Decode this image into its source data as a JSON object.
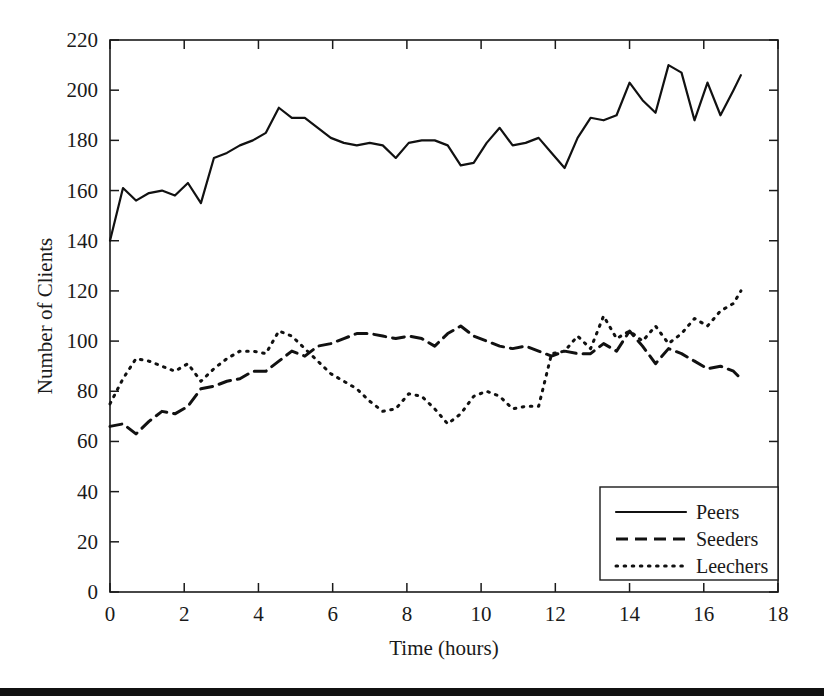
{
  "figure": {
    "background_color": "#ffffff",
    "ink_color": "#111111",
    "bottom_bar_color": "#111111"
  },
  "chart_data": {
    "type": "line",
    "title": "",
    "subtitle": "",
    "xlabel": "Time (hours)",
    "ylabel": "Number of Clients",
    "xlim": [
      0,
      18
    ],
    "ylim": [
      0,
      220
    ],
    "xticks": [
      0,
      2,
      4,
      6,
      8,
      10,
      12,
      14,
      16,
      18
    ],
    "yticks": [
      0,
      20,
      40,
      60,
      80,
      100,
      120,
      140,
      160,
      180,
      200,
      220
    ],
    "xtick_labels": [
      "0",
      "2",
      "4",
      "6",
      "8",
      "10",
      "12",
      "14",
      "16",
      "18"
    ],
    "ytick_labels": [
      "0",
      "20",
      "40",
      "60",
      "80",
      "100",
      "120",
      "140",
      "160",
      "180",
      "200",
      "220"
    ],
    "grid": false,
    "legend_position": "lower right",
    "legend_entries": [
      "Peers",
      "Seeders",
      "Leechers"
    ],
    "x": [
      0.0,
      0.35,
      0.7,
      1.05,
      1.4,
      1.75,
      2.1,
      2.45,
      2.8,
      3.15,
      3.5,
      3.85,
      4.2,
      4.55,
      4.9,
      5.25,
      5.6,
      5.95,
      6.3,
      6.65,
      7.0,
      7.35,
      7.7,
      8.05,
      8.4,
      8.75,
      9.1,
      9.45,
      9.8,
      10.15,
      10.5,
      10.85,
      11.2,
      11.55,
      11.9,
      12.25,
      12.6,
      12.95,
      13.3,
      13.65,
      14.0,
      14.35,
      14.7,
      15.05,
      15.4,
      15.75,
      16.1,
      16.45,
      16.8,
      17.0
    ],
    "series": [
      {
        "name": "Peers",
        "style": "solid",
        "color": "#111111",
        "values": [
          140,
          161,
          156,
          159,
          160,
          158,
          163,
          155,
          173,
          175,
          178,
          180,
          183,
          193,
          189,
          189,
          185,
          181,
          179,
          178,
          179,
          178,
          173,
          179,
          180,
          180,
          178,
          170,
          171,
          179,
          185,
          178,
          179,
          181,
          175,
          169,
          181,
          189,
          188,
          190,
          203,
          196,
          191,
          210,
          207,
          188,
          203,
          190,
          200,
          206
        ]
      },
      {
        "name": "Seeders",
        "style": "dashed",
        "color": "#111111",
        "values": [
          66,
          67,
          63,
          68,
          72,
          71,
          74,
          81,
          82,
          84,
          85,
          88,
          88,
          92,
          96,
          94,
          98,
          99,
          101,
          103,
          103,
          102,
          101,
          102,
          101,
          98,
          103,
          106,
          102,
          100,
          98,
          97,
          98,
          96,
          94,
          96,
          95,
          95,
          99,
          96,
          104,
          98,
          91,
          97,
          95,
          92,
          89,
          90,
          88,
          85
        ]
      },
      {
        "name": "Leechers",
        "style": "dotted",
        "color": "#111111",
        "values": [
          75,
          85,
          93,
          92,
          90,
          88,
          91,
          84,
          89,
          93,
          96,
          96,
          95,
          104,
          102,
          97,
          92,
          87,
          84,
          81,
          76,
          72,
          73,
          79,
          78,
          73,
          67,
          71,
          78,
          80,
          78,
          73,
          74,
          74,
          95,
          96,
          102,
          97,
          110,
          101,
          104,
          100,
          106,
          99,
          103,
          109,
          106,
          112,
          115,
          120
        ]
      }
    ]
  }
}
